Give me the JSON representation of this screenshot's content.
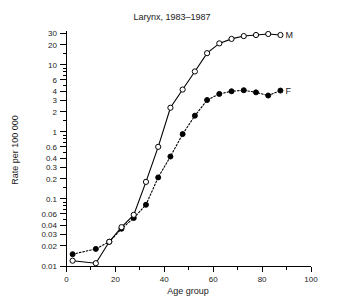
{
  "chart_data": {
    "type": "line",
    "title": "Larynx, 1983–1987",
    "xlabel": "Age group",
    "ylabel": "Rate per 100 000",
    "yscale": "log",
    "xlim": [
      0,
      100
    ],
    "ylim": [
      0.01,
      35
    ],
    "grid": false,
    "legend_position": "right-of-series-end",
    "x_ticks_major": [
      0,
      20,
      40,
      60,
      80,
      100
    ],
    "x_ticks_minor": [
      10,
      30,
      50,
      70,
      90
    ],
    "y_ticks": [
      0.01,
      0.02,
      0.03,
      0.04,
      0.06,
      0.1,
      0.2,
      0.3,
      0.4,
      0.6,
      1,
      2,
      3,
      4,
      6,
      10,
      20,
      30
    ],
    "y_tick_labels": [
      "0.01",
      "0.02",
      "0.03",
      "0.04",
      "0.06",
      "0.1",
      "0.2",
      "0.3",
      "0.4",
      "0.6",
      "1",
      "2",
      "3",
      "4",
      "6",
      "10",
      "20",
      "30"
    ],
    "series": [
      {
        "name": "M",
        "label": "M",
        "marker": "open-circle",
        "linestyle": "solid",
        "x": [
          2.5,
          12,
          17.5,
          22.5,
          27.5,
          32.5,
          37.5,
          42.5,
          47.5,
          52.5,
          57.5,
          62.5,
          67.5,
          72.5,
          77.5,
          82.5,
          87.5
        ],
        "values": [
          0.012,
          0.011,
          0.023,
          0.038,
          0.058,
          0.18,
          0.6,
          2.3,
          4.3,
          8.0,
          15.0,
          21.0,
          24.5,
          27.0,
          28.0,
          29.0,
          28.0
        ]
      },
      {
        "name": "F",
        "label": "F",
        "marker": "filled-circle",
        "linestyle": "dotted",
        "x": [
          2.5,
          12,
          17.5,
          22.5,
          27.5,
          32.5,
          37.5,
          42.5,
          47.5,
          52.5,
          57.5,
          62.5,
          67.5,
          72.5,
          77.5,
          82.5,
          87.5
        ],
        "values": [
          0.015,
          0.018,
          0.023,
          0.036,
          0.052,
          0.082,
          0.21,
          0.43,
          0.93,
          1.75,
          3.0,
          3.7,
          4.05,
          4.2,
          3.9,
          3.5,
          4.15
        ]
      }
    ]
  },
  "labels": {
    "title": "Larynx, 1983–1987",
    "x_axis": "Age group",
    "y_axis": "Rate per 100 000",
    "series_m": "M",
    "series_f": "F"
  },
  "colors": {
    "ink": "#000000",
    "background": "#ffffff"
  }
}
